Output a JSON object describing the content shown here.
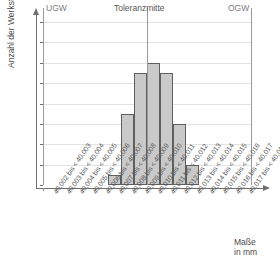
{
  "chart_data": {
    "type": "bar",
    "title": "",
    "subtitle": "",
    "xlabel": "Maße in mm",
    "ylabel": "Anzahl der Werkstücke",
    "ylim": [
      0,
      16
    ],
    "ytick_step": 2,
    "yticks": [
      0,
      2,
      4,
      6,
      8,
      10,
      12,
      14,
      16
    ],
    "grid": true,
    "legend": "none",
    "categories": [
      "40,002 bis < 40,003",
      "40,003 bis < 40,004",
      "40,004 bis < 40,005",
      "40,005 bis < 40,006",
      "40,006 bis < 40,007",
      "40,007 bis < 40,008",
      "40,008 bis < 40,009",
      "40,009 bis < 40,010",
      "40,010 bis < 40,011",
      "40,011 bis < 40,012",
      "40,012 bis < 40,013",
      "40,013 bis < 40,014",
      "40,014 bis < 40,015",
      "40,015 bis < 40,016",
      "40,016 bis < 40,017",
      "40,017 bis < 40,018"
    ],
    "values": [
      0,
      0,
      0,
      0,
      0,
      1,
      7,
      11,
      12,
      11,
      6,
      2,
      0,
      0,
      0,
      0
    ],
    "bar_fill": "#c9c9c9",
    "bar_edge": "#5f5f5f",
    "annotations": [
      {
        "name": "UGW",
        "label": "UGW",
        "at_category_edge": 0
      },
      {
        "name": "Toleranzmitte",
        "label": "Toleranzmitte",
        "at_category_edge": 8
      },
      {
        "name": "OGW",
        "label": "OGW",
        "at_category_edge": 16
      }
    ]
  },
  "axis": {
    "y_title": "Anzahl der Werkstücke",
    "x_title_line1": "Maße",
    "x_title_line2": "in mm"
  },
  "limits": {
    "lower_label": "UGW",
    "center_label": "Toleranzmitte",
    "upper_label": "OGW"
  }
}
